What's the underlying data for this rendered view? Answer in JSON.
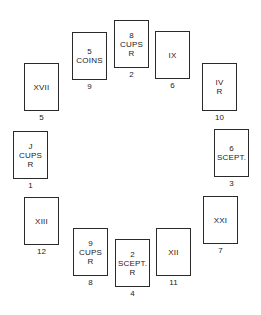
{
  "diagram": {
    "type": "tarot-circular-spread",
    "cards": [
      {
        "position": "1",
        "lines": [
          "J",
          "CUPS",
          "R"
        ],
        "x": 13,
        "y": 131
      },
      {
        "position": "2",
        "lines": [
          "8",
          "CUPS",
          "R"
        ],
        "x": 114,
        "y": 20
      },
      {
        "position": "3",
        "lines": [
          "6",
          "SCEPT."
        ],
        "x": 214,
        "y": 129
      },
      {
        "position": "4",
        "lines": [
          "2",
          "SCEPT.",
          "R"
        ],
        "x": 115,
        "y": 239
      },
      {
        "position": "5",
        "lines": [
          "XVII"
        ],
        "x": 24,
        "y": 63
      },
      {
        "position": "6",
        "lines": [
          "IX"
        ],
        "x": 155,
        "y": 31
      },
      {
        "position": "7",
        "lines": [
          "XXI"
        ],
        "x": 203,
        "y": 196
      },
      {
        "position": "8",
        "lines": [
          "9",
          "CUPS",
          "R"
        ],
        "x": 73,
        "y": 228
      },
      {
        "position": "9",
        "lines": [
          "5",
          "COINS"
        ],
        "x": 72,
        "y": 32
      },
      {
        "position": "10",
        "lines": [
          "IV",
          "R"
        ],
        "x": 202,
        "y": 63
      },
      {
        "position": "11",
        "lines": [
          "XII"
        ],
        "x": 156,
        "y": 228
      },
      {
        "position": "12",
        "lines": [
          "XIII"
        ],
        "x": 24,
        "y": 197
      }
    ]
  }
}
